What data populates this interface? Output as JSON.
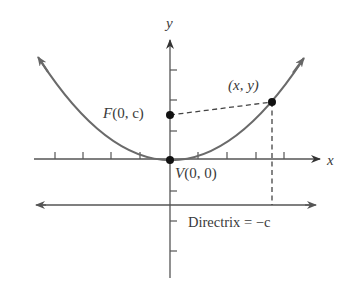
{
  "diagram": {
    "type": "parabola-focus-directrix",
    "axes": {
      "x_label": "x",
      "y_label": "y"
    },
    "points": {
      "focus": {
        "name": "F",
        "coords": "(0, c)"
      },
      "vertex": {
        "name": "V",
        "coords": "(0, 0)"
      },
      "general": {
        "label": "(x, y)"
      }
    },
    "directrix": {
      "label": "Directrix = −c"
    },
    "colors": {
      "axis": "#555555",
      "curve": "#6a6a6a",
      "point": "#111111",
      "text": "#3a3a3a"
    }
  }
}
